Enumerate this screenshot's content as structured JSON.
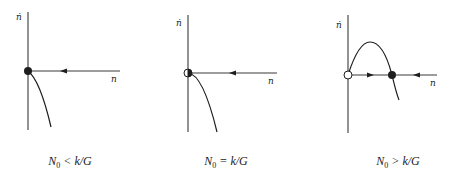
{
  "figure": {
    "panels": [
      {
        "id": "panel-1",
        "y_axis_label": "ṅ",
        "x_axis_label": "n",
        "caption": {
          "var": "N",
          "sub": "0",
          "rel": " < k/G"
        },
        "equilibria": [
          {
            "position": "origin",
            "style": "filled",
            "meaning": "stable"
          }
        ],
        "flow_arrows": [
          {
            "direction": "left",
            "segment": "positive n"
          }
        ],
        "curve": "decreasing from origin into negative ṅ"
      },
      {
        "id": "panel-2",
        "y_axis_label": "ṅ",
        "x_axis_label": "n",
        "caption": {
          "var": "N",
          "sub": "0",
          "rel": " = k/G"
        },
        "equilibria": [
          {
            "position": "origin",
            "style": "half-filled",
            "meaning": "semi-stable"
          }
        ],
        "flow_arrows": [
          {
            "direction": "left",
            "segment": "positive n"
          }
        ],
        "curve": "tangent at origin, decreasing into negative ṅ"
      },
      {
        "id": "panel-3",
        "y_axis_label": "ṅ",
        "x_axis_label": "n",
        "caption": {
          "var": "N",
          "sub": "0",
          "rel": " > k/G"
        },
        "equilibria": [
          {
            "position": "origin",
            "style": "open",
            "meaning": "unstable"
          },
          {
            "position": "positive n root",
            "style": "filled",
            "meaning": "stable"
          }
        ],
        "flow_arrows": [
          {
            "direction": "right",
            "segment": "between origin and root"
          },
          {
            "direction": "left",
            "segment": "beyond root"
          }
        ],
        "curve": "hump above axis then crossing down through root"
      }
    ],
    "colors": {
      "ink": "#1e1e1e",
      "axis": "#3a3a3a",
      "background": "#ffffff"
    }
  }
}
